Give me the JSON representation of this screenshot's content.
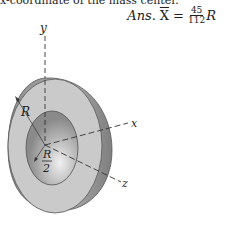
{
  "header": {
    "cutoff_text": "x-coordinate of the mass center.",
    "answer_prefix": "Ans.",
    "answer_var": "X",
    "answer_eq": "=",
    "answer_numerator": "45",
    "answer_denominator": "112",
    "answer_suffix": "R"
  },
  "figure": {
    "axis_labels": {
      "y": "y",
      "x": "x",
      "z": "z"
    },
    "dimension_labels": {
      "outer_radius": "R",
      "inner_radius_num": "R",
      "inner_radius_den": "2"
    },
    "colors": {
      "front_face": "#c9c9c9",
      "side_shell": "#9a9a9a",
      "inner_hole": "#b0b0b0",
      "outline": "#555555",
      "axis": "#333333"
    }
  }
}
